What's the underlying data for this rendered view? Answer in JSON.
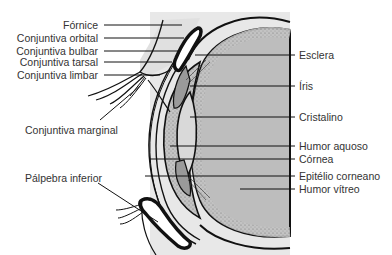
{
  "figure": {
    "type": "anatomical-diagram",
    "colors": {
      "background": "#ffffff",
      "panel": "#e6e6e6",
      "vitreous": "#bdbdbd",
      "stipple": "#8a8a8a",
      "outline": "#111111",
      "lens": "#d9d9d9",
      "label_text": "#333333"
    }
  },
  "labels_left": [
    {
      "id": "fornice",
      "text": "Fórnice"
    },
    {
      "id": "conjuntiva-orbital",
      "text": "Conjuntiva orbital"
    },
    {
      "id": "conjuntiva-bulbar",
      "text": "Conjuntiva bulbar"
    },
    {
      "id": "conjuntiva-tarsal",
      "text": "Conjuntiva tarsal"
    },
    {
      "id": "conjuntiva-limbar",
      "text": "Conjuntiva limbar"
    },
    {
      "id": "conjuntiva-marginal",
      "text": "Conjuntiva marginal"
    },
    {
      "id": "palpebra-inferior",
      "text": "Pálpebra inferior"
    }
  ],
  "labels_right": [
    {
      "id": "esclera",
      "text": "Esclera"
    },
    {
      "id": "iris",
      "text": "Íris"
    },
    {
      "id": "cristalino",
      "text": "Cristalino"
    },
    {
      "id": "humor-aquoso",
      "text": "Humor aquoso"
    },
    {
      "id": "cornea",
      "text": "Córnea"
    },
    {
      "id": "epitelio-corneano",
      "text": "Epitélio corneano"
    },
    {
      "id": "humor-vitreo",
      "text": "Humor vítreo"
    }
  ]
}
